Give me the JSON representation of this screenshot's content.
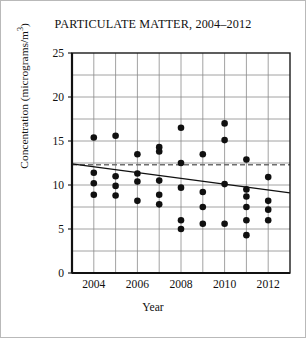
{
  "chart_data": {
    "type": "scatter",
    "title": "PARTICULATE MATTER, 2004–2012",
    "xlabel": "Year",
    "ylabel": "Concentration (micrograms/m³)",
    "ylabel_main": "Concentration (micrograms/m",
    "ylabel_sup": "3",
    "ylabel_tail": ")",
    "xlim": [
      2003,
      2013
    ],
    "ylim": [
      0,
      25
    ],
    "grid": true,
    "legend": "none",
    "x_ticks": [
      2004,
      2006,
      2008,
      2010,
      2012
    ],
    "x_tick_labels": [
      "2004",
      "2006",
      "2008",
      "2010",
      "2012"
    ],
    "x_gridlines": [
      2004,
      2005,
      2006,
      2007,
      2008,
      2009,
      2010,
      2011,
      2012
    ],
    "y_ticks": [
      0,
      5,
      10,
      15,
      20,
      25
    ],
    "y_tick_labels": [
      "0",
      "5",
      "10",
      "15",
      "20",
      "25"
    ],
    "y_gridlines": [
      2.5,
      5,
      7.5,
      10,
      12.5,
      15,
      17.5,
      20,
      22.5
    ],
    "points": [
      {
        "x": 2004,
        "y": 15.4
      },
      {
        "x": 2004,
        "y": 11.4
      },
      {
        "x": 2004,
        "y": 10.2
      },
      {
        "x": 2004,
        "y": 8.9
      },
      {
        "x": 2005,
        "y": 15.6
      },
      {
        "x": 2005,
        "y": 11.0
      },
      {
        "x": 2005,
        "y": 9.9
      },
      {
        "x": 2005,
        "y": 8.8
      },
      {
        "x": 2006,
        "y": 13.5
      },
      {
        "x": 2006,
        "y": 11.3
      },
      {
        "x": 2006,
        "y": 10.4
      },
      {
        "x": 2006,
        "y": 8.2
      },
      {
        "x": 2007,
        "y": 14.3
      },
      {
        "x": 2007,
        "y": 13.8
      },
      {
        "x": 2007,
        "y": 10.5
      },
      {
        "x": 2007,
        "y": 8.9
      },
      {
        "x": 2007,
        "y": 7.8
      },
      {
        "x": 2008,
        "y": 16.5
      },
      {
        "x": 2008,
        "y": 12.5
      },
      {
        "x": 2008,
        "y": 9.7
      },
      {
        "x": 2008,
        "y": 6.0
      },
      {
        "x": 2008,
        "y": 5.0
      },
      {
        "x": 2009,
        "y": 13.5
      },
      {
        "x": 2009,
        "y": 9.2
      },
      {
        "x": 2009,
        "y": 7.5
      },
      {
        "x": 2009,
        "y": 5.6
      },
      {
        "x": 2010,
        "y": 17.0
      },
      {
        "x": 2010,
        "y": 15.1
      },
      {
        "x": 2010,
        "y": 10.1
      },
      {
        "x": 2010,
        "y": 5.6
      },
      {
        "x": 2011,
        "y": 12.9
      },
      {
        "x": 2011,
        "y": 9.5
      },
      {
        "x": 2011,
        "y": 8.7
      },
      {
        "x": 2011,
        "y": 7.5
      },
      {
        "x": 2011,
        "y": 6.0
      },
      {
        "x": 2011,
        "y": 4.3
      },
      {
        "x": 2012,
        "y": 10.9
      },
      {
        "x": 2012,
        "y": 8.2
      },
      {
        "x": 2012,
        "y": 7.2
      },
      {
        "x": 2012,
        "y": 6.0
      }
    ],
    "trend_line": {
      "x0": 2003,
      "y0": 12.4,
      "x1": 2013,
      "y1": 9.1,
      "style": "solid"
    },
    "reference_line": {
      "y": 12.3,
      "style": "dashed"
    },
    "colors": {
      "point": "#101010",
      "trend": "#111111",
      "reference": "#6f6f6f",
      "grid": "#8a8a8a",
      "frame": "#1a1a1a",
      "border": "#b9b9b9",
      "background": "#ffffff"
    }
  }
}
